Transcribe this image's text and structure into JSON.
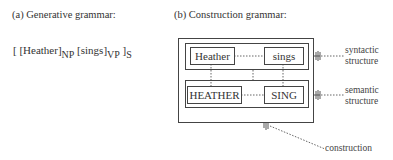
{
  "panel_a": {
    "caption": "(a) Generative grammar:",
    "formula": {
      "open": "[ [Heather]",
      "np": "NP",
      "mid": " [sings]",
      "vp": "VP",
      "close": " ]",
      "s": "S"
    }
  },
  "panel_b": {
    "caption": "(b) Construction grammar:",
    "syntactic_words": [
      "Heather",
      "sings"
    ],
    "semantic_words": [
      "HEATHER",
      "SING"
    ],
    "labels": {
      "syntactic": [
        "syntactic",
        "structure"
      ],
      "semantic": [
        "semantic",
        "structure"
      ],
      "construction": "construction"
    }
  }
}
